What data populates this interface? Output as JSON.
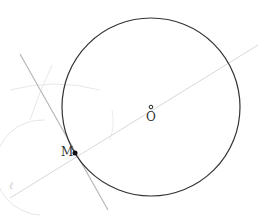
{
  "diagram": {
    "points": [
      {
        "name": "O",
        "label": "O",
        "x": 151,
        "y": 107
      },
      {
        "name": "M",
        "label": "M",
        "x": 75,
        "y": 153
      }
    ],
    "circle": {
      "center": "O",
      "radius": 89
    },
    "lines": [
      {
        "name": "radial-line",
        "through": [
          "M",
          "O"
        ]
      },
      {
        "name": "tangent-line",
        "through": [
          "M"
        ],
        "perpendicular_to": "radial-line"
      }
    ],
    "line_label": "ℓ",
    "colors": {
      "circle": "#333333",
      "construction": "#d8d8d8",
      "tangent": "#b0b0b0",
      "point": "#111111"
    }
  }
}
